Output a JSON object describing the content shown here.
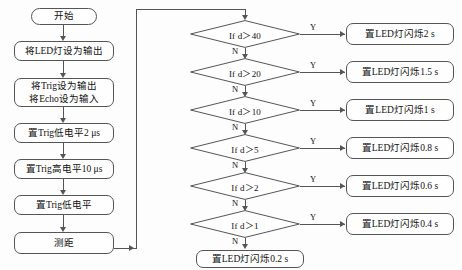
{
  "diagram": {
    "type": "flowchart",
    "colors": {
      "stroke": "#555555",
      "text": "#111111",
      "background": "#fdfdfd"
    }
  },
  "left_column": {
    "start": "开始",
    "steps": [
      {
        "id": "led-output",
        "text": "将LED灯设为输出"
      },
      {
        "id": "trig-echo",
        "line1": "将Trig设为输出",
        "line2": "将Echo设为输入"
      },
      {
        "id": "trig-low-2us",
        "text": "置Trig低电平2 μs"
      },
      {
        "id": "trig-high-10us",
        "text": "置Trig高电平10 μs"
      },
      {
        "id": "trig-low",
        "text": "置Trig低电平"
      },
      {
        "id": "measure",
        "text": "测距"
      }
    ]
  },
  "decisions": [
    {
      "id": "d-gt-40",
      "condition": "If d＞40",
      "yes_label": "Y",
      "no_label": "N"
    },
    {
      "id": "d-gt-20",
      "condition": "If d＞20",
      "yes_label": "Y",
      "no_label": "N"
    },
    {
      "id": "d-gt-10",
      "condition": "If d＞10",
      "yes_label": "Y",
      "no_label": "N"
    },
    {
      "id": "d-gt-5",
      "condition": "If d＞5",
      "yes_label": "Y",
      "no_label": "N"
    },
    {
      "id": "d-gt-2",
      "condition": "If d＞2",
      "yes_label": "Y",
      "no_label": "N"
    },
    {
      "id": "d-gt-1",
      "condition": "If d＞1",
      "yes_label": "Y",
      "no_label": "N"
    }
  ],
  "actions": [
    {
      "id": "blink-2s",
      "text": "置LED灯闪烁2 s"
    },
    {
      "id": "blink-1_5s",
      "text": "置LED灯闪烁1.5 s"
    },
    {
      "id": "blink-1s",
      "text": "置LED灯闪烁1 s"
    },
    {
      "id": "blink-0_8s",
      "text": "置LED灯闪烁0.8 s"
    },
    {
      "id": "blink-0_6s",
      "text": "置LED灯闪烁0.6 s"
    },
    {
      "id": "blink-0_4s",
      "text": "置LED灯闪烁0.4 s"
    }
  ],
  "default_action": {
    "id": "blink-0_2s",
    "text": "置LED灯闪烁0.2 s"
  }
}
